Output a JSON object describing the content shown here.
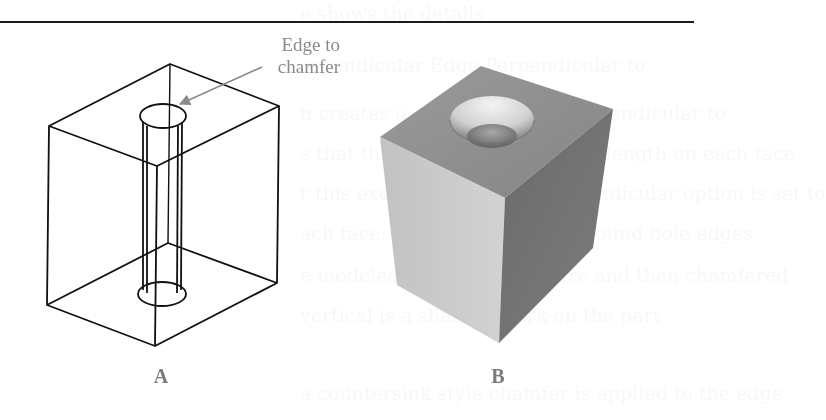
{
  "figure": {
    "callout": {
      "line1": "Edge to",
      "line2": "chamfer"
    },
    "panels": [
      {
        "id": "A",
        "label": "A",
        "description": "wireframe-block-with-through-hole"
      },
      {
        "id": "B",
        "label": "B",
        "description": "shaded-block-with-chamfered-hole"
      }
    ],
    "colors": {
      "wireframe": "#111111",
      "callout": "#8a8a8a",
      "label": "#7a7a7a",
      "top_face": "#8e8e8e",
      "left_face": "#c8c8c8",
      "right_face": "#6e6e6e"
    }
  },
  "show_through": [
    "e shows the details",
    "erpendicular Edge Perpendicular to",
    "n creates a chamfer that is perpendicular to",
    "s that the edges have the same length on each face",
    "r this exercise, the Edge Perpendicular option is set to",
    "ach face; ideal for chamfers around hole edges",
    "e modeled with a hole feature and then chamfered",
    "vertical is a shallow mark on the part",
    "a countersink style chamfer is applied to the edge"
  ]
}
